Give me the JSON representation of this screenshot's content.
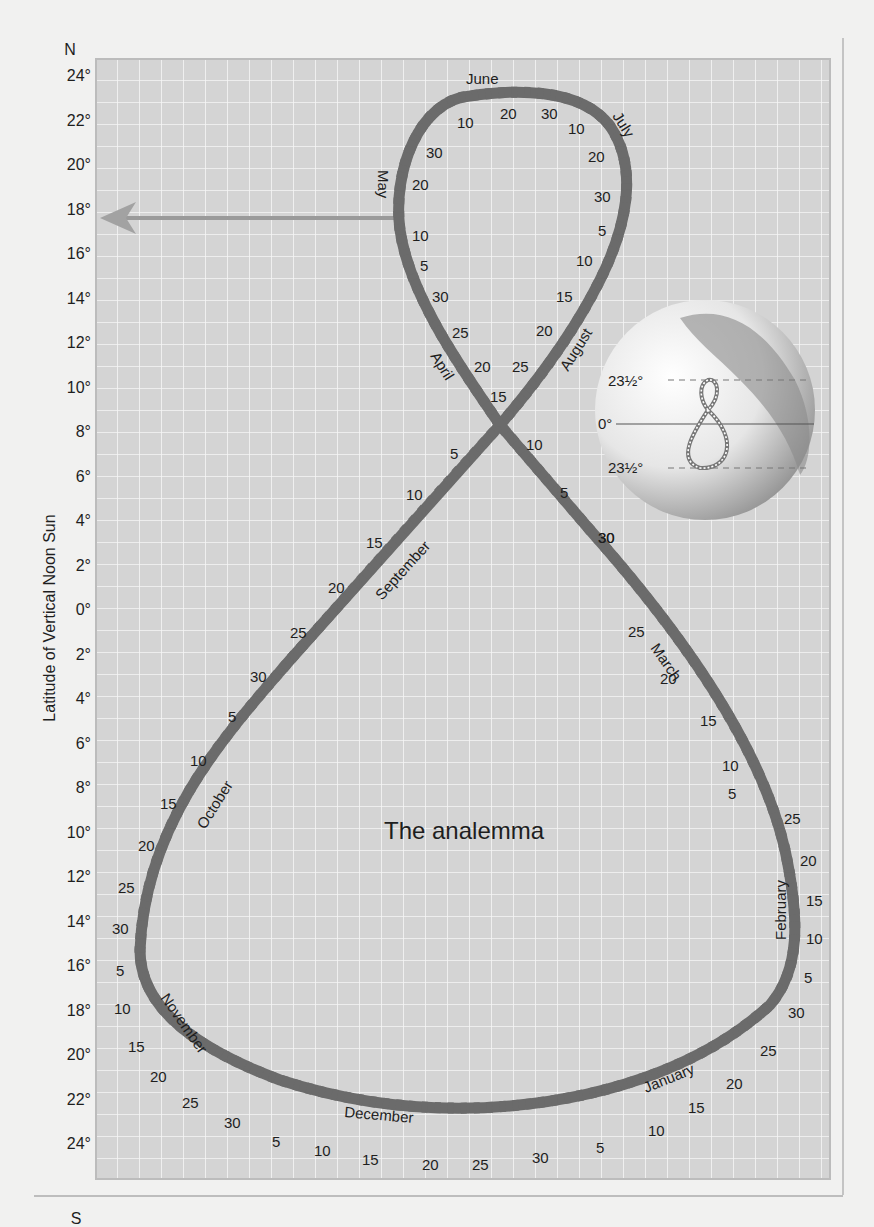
{
  "figure": {
    "title": "The analemma",
    "y_axis": {
      "label": "Latitude of Vertical Noon Sun",
      "north_label": "N",
      "south_label": "S",
      "ticks": [
        "24°",
        "22°",
        "20°",
        "18°",
        "16°",
        "14°",
        "12°",
        "10°",
        "8°",
        "6°",
        "4°",
        "2°",
        "0°",
        "2°",
        "4°",
        "6°",
        "8°",
        "10°",
        "12°",
        "14°",
        "16°",
        "18°",
        "20°",
        "22°",
        "24°"
      ]
    },
    "arrow": {
      "points_to": "18°"
    },
    "months": {
      "june": "June",
      "july": "July",
      "may": "May",
      "april": "April",
      "august": "August",
      "september": "September",
      "march": "March",
      "october": "October",
      "february": "February",
      "november": "November",
      "december": "December",
      "january": "January"
    },
    "inset_globe": {
      "tropic_north": "23½°",
      "equator": "0°",
      "tropic_south": "23½°"
    },
    "colors": {
      "grid_bg": "#d3d3d3",
      "grid_line": "#f4f4f4",
      "curve": "#6b6b6b",
      "curve_dash": "#ffffff",
      "text": "#1e1e1e",
      "arrow": "#9a9a9a"
    }
  },
  "chart_data": {
    "type": "line",
    "title": "The analemma",
    "xlabel": "",
    "ylabel": "Latitude of Vertical Noon Sun",
    "ylim": [
      -24,
      24
    ],
    "y_tick_labels": [
      "24° N",
      "22°",
      "20°",
      "18°",
      "16°",
      "14°",
      "12°",
      "10°",
      "8°",
      "6°",
      "4°",
      "2°",
      "0°",
      "2°",
      "4°",
      "6°",
      "8°",
      "10°",
      "12°",
      "14°",
      "16°",
      "18°",
      "20°",
      "22°",
      "24° S"
    ],
    "grid": true,
    "series": [
      {
        "name": "Analemma (declination of noon sun by date)",
        "points": [
          {
            "date": "Jun 21",
            "lat": 23.5
          },
          {
            "date": "Jul 1",
            "lat": 23.1
          },
          {
            "date": "Jul 30",
            "lat": 18.5
          },
          {
            "date": "Aug 15",
            "lat": 14.0
          },
          {
            "date": "Aug 31",
            "lat": 8.5
          },
          {
            "date": "Sep 22",
            "lat": 0.0
          },
          {
            "date": "Sep 30",
            "lat": -3.0
          },
          {
            "date": "Oct 31",
            "lat": -14.0
          },
          {
            "date": "Nov 30",
            "lat": -21.7
          },
          {
            "date": "Dec 21",
            "lat": -23.5
          },
          {
            "date": "Dec 31",
            "lat": -23.1
          },
          {
            "date": "Jan 31",
            "lat": -17.5
          },
          {
            "date": "Feb 28",
            "lat": -8.3
          },
          {
            "date": "Mar 20",
            "lat": 0.0
          },
          {
            "date": "Mar 31",
            "lat": 4.0
          },
          {
            "date": "Apr 15",
            "lat": 9.5
          },
          {
            "date": "Apr 30",
            "lat": 14.8
          },
          {
            "date": "May 15",
            "lat": 18.6
          },
          {
            "date": "May 31",
            "lat": 21.9
          },
          {
            "date": "Jun 21",
            "lat": 23.5
          }
        ]
      }
    ],
    "annotations": [
      "June",
      "July",
      "August",
      "September",
      "October",
      "November",
      "December",
      "January",
      "February",
      "March",
      "April",
      "May",
      "The analemma"
    ],
    "inset": {
      "labels": [
        "23½°",
        "0°",
        "23½°"
      ],
      "description": "globe with small analemma figure-eight"
    }
  }
}
